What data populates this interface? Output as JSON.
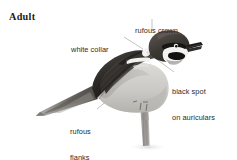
{
  "plate": {
    "width": 237,
    "height": 160,
    "background_color": "#ffffff",
    "subject": "sparrow-illustration",
    "age_label": "Adult"
  },
  "annotations": [
    {
      "id": "rufous-crown",
      "lines": [
        "rufous crown"
      ],
      "text": "rufous crown",
      "points_to": "crown"
    },
    {
      "id": "white-collar",
      "lines": [
        "white collar"
      ],
      "text": "white collar",
      "points_to": "nape-collar"
    },
    {
      "id": "black-spot",
      "lines": [
        "black spot",
        "on auriculars"
      ],
      "text": "black spot on auriculars",
      "points_to": "auriculars"
    },
    {
      "id": "rufous-flanks",
      "lines": [
        "rufous",
        "flanks"
      ],
      "text": "rufous flanks",
      "points_to": "flanks"
    }
  ],
  "colors": {
    "text": "#2b2b2b",
    "age_text": "#1a1a1a",
    "leader_line": "#9a9a9a",
    "crown_dark": "#3a3a3a",
    "mantle_dark": "#2e2e2e",
    "wing_dark": "#33302e",
    "wingbar_white": "#f2f1ee",
    "underparts_pale": "#cfcecb",
    "flank_grey": "#b8b6b2",
    "bill_black": "#1c1c1c",
    "eye_black": "#141414",
    "perch_grey": "#a8a7a3",
    "background": "#ffffff"
  }
}
